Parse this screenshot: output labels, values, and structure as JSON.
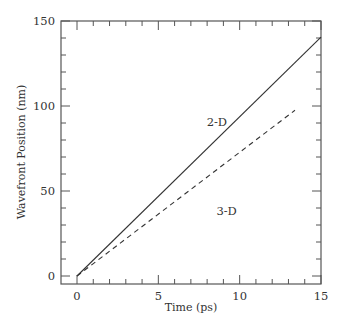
{
  "chart_data": {
    "type": "line",
    "title": "",
    "xlabel": "Time (ps)",
    "ylabel": "Wavefront Position (nm)",
    "xlim": [
      -1,
      15
    ],
    "ylim": [
      -5,
      150
    ],
    "xticks": [
      0,
      5,
      10,
      15
    ],
    "yticks": [
      0,
      50,
      100,
      150
    ],
    "x_minor_step": 1,
    "y_minor_step": 10,
    "grid": false,
    "legend": null,
    "series": [
      {
        "name": "2-D",
        "style": "solid",
        "x": [
          0,
          15
        ],
        "y": [
          0,
          140.5
        ]
      },
      {
        "name": "3-D",
        "style": "dashed",
        "x": [
          0,
          13.4
        ],
        "y": [
          0,
          97.5
        ]
      }
    ],
    "annotations": [
      {
        "text": "2-D",
        "x": 8.6,
        "y": 88
      },
      {
        "text": "3-D",
        "x": 9.2,
        "y": 36
      }
    ],
    "colors": {
      "line": "#333333",
      "axis": "#555555"
    }
  }
}
